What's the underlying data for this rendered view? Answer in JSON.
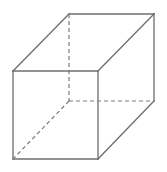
{
  "diagram": {
    "type": "wireframe-cube",
    "colors": {
      "background": "#ffffff",
      "edge": "#6e6e6e",
      "hidden_edge": "#7a7a7a"
    },
    "vertices": {
      "front_top_left": [
        13,
        71
      ],
      "front_top_right": [
        98,
        71
      ],
      "front_bottom_left": [
        13,
        159
      ],
      "front_bottom_right": [
        98,
        159
      ],
      "back_top_left": [
        69,
        14
      ],
      "back_top_right": [
        154,
        14
      ],
      "back_bottom_left": [
        69,
        101
      ],
      "back_bottom_right": [
        154,
        101
      ]
    },
    "visible_edges": [
      [
        "front_top_left",
        "front_top_right"
      ],
      [
        "front_top_right",
        "front_bottom_right"
      ],
      [
        "front_bottom_right",
        "front_bottom_left"
      ],
      [
        "front_bottom_left",
        "front_top_left"
      ],
      [
        "front_top_left",
        "back_top_left"
      ],
      [
        "back_top_left",
        "back_top_right"
      ],
      [
        "front_top_right",
        "back_top_right"
      ],
      [
        "back_top_right",
        "back_bottom_right"
      ],
      [
        "front_bottom_right",
        "back_bottom_right"
      ]
    ],
    "hidden_edges": [
      [
        "back_top_left",
        "back_bottom_left"
      ],
      [
        "back_bottom_left",
        "back_bottom_right"
      ],
      [
        "back_bottom_left",
        "front_bottom_left"
      ]
    ]
  }
}
